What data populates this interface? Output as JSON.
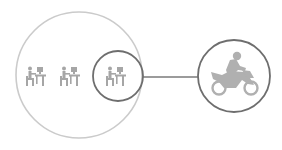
{
  "diagram": {
    "colors": {
      "background": "#ffffff",
      "outer_circle": "#c8c8c8",
      "inner_circle": "#6e6e6e",
      "connector": "#777777",
      "icon_fill": "#a8a8a8"
    },
    "nodes": [
      {
        "id": "group",
        "shape": "circle",
        "cx": 79,
        "cy": 75,
        "r": 63,
        "label": ""
      },
      {
        "id": "highlighted-worker",
        "shape": "circle",
        "cx": 118,
        "cy": 76,
        "r": 25,
        "label": ""
      },
      {
        "id": "motorcycle",
        "shape": "circle",
        "cx": 234,
        "cy": 76,
        "r": 36,
        "label": ""
      }
    ],
    "icons": [
      {
        "name": "desk-worker-icon",
        "x": 26,
        "y": 66
      },
      {
        "name": "desk-worker-icon",
        "x": 60,
        "y": 66
      },
      {
        "name": "desk-worker-icon",
        "x": 106,
        "y": 66
      },
      {
        "name": "motorcycle-rider-icon",
        "x": 210,
        "y": 54
      }
    ],
    "edges": [
      {
        "from": "highlighted-worker",
        "to": "motorcycle"
      }
    ]
  }
}
